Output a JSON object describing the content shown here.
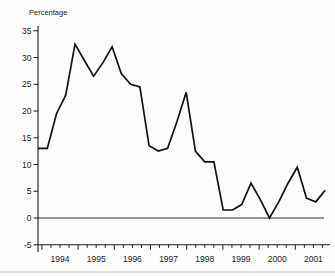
{
  "colors": {
    "line": "#111111",
    "axis": "#1a1a1a",
    "background": "#fdfdfd",
    "page_edge": "#cccccc"
  },
  "chart_data": {
    "type": "line",
    "title": "",
    "ylabel": "Percentage",
    "xlabel": "",
    "grid": false,
    "legend": "none",
    "ylim": [
      -5,
      35
    ],
    "y_ticks": [
      35,
      30,
      25,
      20,
      15,
      10,
      5,
      0,
      -5
    ],
    "year_labels": [
      "1994",
      "1995",
      "1996",
      "1997",
      "1998",
      "1999",
      "2000",
      "2001"
    ],
    "x": [
      "1993Q4",
      "1994Q1",
      "1994Q2",
      "1994Q3",
      "1994Q4",
      "1995Q1",
      "1995Q2",
      "1995Q3",
      "1995Q4",
      "1996Q1",
      "1996Q2",
      "1996Q3",
      "1996Q4",
      "1997Q1",
      "1997Q2",
      "1997Q3",
      "1997Q4",
      "1998Q1",
      "1998Q2",
      "1998Q3",
      "1998Q4",
      "1999Q1",
      "1999Q2",
      "1999Q3",
      "1999Q4",
      "2000Q1",
      "2000Q2",
      "2000Q3",
      "2000Q4",
      "2001Q1",
      "2001Q2",
      "2001Q3"
    ],
    "values": [
      13,
      13,
      19.5,
      23,
      32.5,
      29.5,
      26.5,
      29,
      32,
      27,
      25,
      24.5,
      13.5,
      12.5,
      13,
      18,
      23.5,
      12.5,
      10.5,
      10.5,
      1.5,
      1.5,
      2.5,
      6.5,
      3.5,
      0,
      3,
      6.5,
      9.5,
      3.7,
      3,
      5.2
    ]
  }
}
